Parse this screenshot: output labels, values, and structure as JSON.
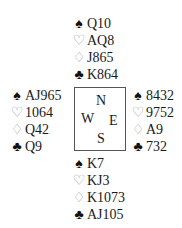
{
  "diagram": {
    "type": "bridge-deal",
    "compass": {
      "north": "N",
      "west": "W",
      "east": "E",
      "south": "S"
    },
    "suit_symbols": {
      "spades": "♠",
      "hearts": "♡",
      "diamonds": "♢",
      "clubs": "♣"
    },
    "hands": {
      "north": {
        "spades": "Q10",
        "hearts": "AQ8",
        "diamonds": "J865",
        "clubs": "K864"
      },
      "west": {
        "spades": "AJ965",
        "hearts": "1064",
        "diamonds": "Q42",
        "clubs": "Q9"
      },
      "east": {
        "spades": "8432",
        "hearts": "9752",
        "diamonds": "A9",
        "clubs": "732"
      },
      "south": {
        "spades": "K7",
        "hearts": "KJ3",
        "diamonds": "K1073",
        "clubs": "AJ105"
      }
    }
  }
}
